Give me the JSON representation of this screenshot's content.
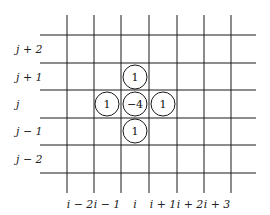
{
  "diagram": {
    "type": "finite-difference stencil (five-point Laplacian)",
    "row_labels": [
      {
        "text": "j + 2",
        "y": 49
      },
      {
        "text": "j + 1",
        "y": 77
      },
      {
        "text": "j",
        "y": 104
      },
      {
        "text": "j − 1",
        "y": 131
      },
      {
        "text": "j − 2",
        "y": 159
      }
    ],
    "column_labels": [
      {
        "text": "i − 2",
        "x": 80
      },
      {
        "text": "i − 1",
        "x": 107
      },
      {
        "text": "i",
        "x": 135
      },
      {
        "text": "i + 1",
        "x": 163
      },
      {
        "text": "i + 2",
        "x": 190
      },
      {
        "text": "i + 3",
        "x": 217
      }
    ],
    "vertical_lines_x": [
      67,
      94,
      121,
      149,
      177,
      204,
      231
    ],
    "horizontal_lines_y": [
      35,
      63,
      90,
      118,
      145,
      173
    ],
    "stencil_nodes": [
      {
        "position": "top",
        "value": "1",
        "cx": 135,
        "cy": 77
      },
      {
        "position": "left",
        "value": "1",
        "cx": 107,
        "cy": 104
      },
      {
        "position": "center",
        "value": "−4",
        "cx": 135,
        "cy": 104
      },
      {
        "position": "right",
        "value": "1",
        "cx": 163,
        "cy": 104
      },
      {
        "position": "bottom",
        "value": "1",
        "cx": 135,
        "cy": 131
      }
    ]
  }
}
